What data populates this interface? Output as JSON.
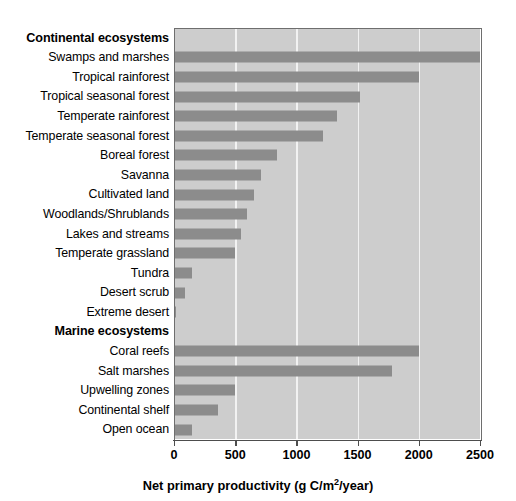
{
  "chart_data": {
    "type": "bar",
    "orientation": "horizontal",
    "title": "",
    "xlabel": "Net primary productivity (g C/m2/year)",
    "ylabel": "",
    "xlim": [
      0,
      2500
    ],
    "xticks": [
      0,
      500,
      1000,
      1500,
      2000,
      2500
    ],
    "xtick_labels": [
      "0",
      "500",
      "1000",
      "1500",
      "2000",
      "2500"
    ],
    "grid": true,
    "legend": false,
    "bar_color": "#8c8c8c",
    "plot_background": "#cdcdcd",
    "groups": [
      {
        "header": "Continental ecosystems",
        "categories": [
          "Swamps and marshes",
          "Tropical rainforest",
          "Tropical seasonal forest",
          "Temperate rainforest",
          "Temperate seasonal forest",
          "Boreal forest",
          "Savanna",
          "Cultivated land",
          "Woodlands/Shrublands",
          "Lakes and streams",
          "Temperate grassland",
          "Tundra",
          "Desert scrub",
          "Extreme desert"
        ],
        "values": [
          2500,
          2000,
          1520,
          1335,
          1220,
          840,
          710,
          650,
          600,
          550,
          500,
          150,
          90,
          15
        ]
      },
      {
        "header": "Marine ecosystems",
        "categories": [
          "Coral reefs",
          "Salt marshes",
          "Upwelling zones",
          "Continental shelf",
          "Open ocean"
        ],
        "values": [
          2000,
          1780,
          500,
          360,
          150
        ]
      }
    ]
  },
  "axis": {
    "title_prefix": "Net primary productivity (g C/m",
    "title_exponent": "2",
    "title_suffix": "/year)"
  }
}
